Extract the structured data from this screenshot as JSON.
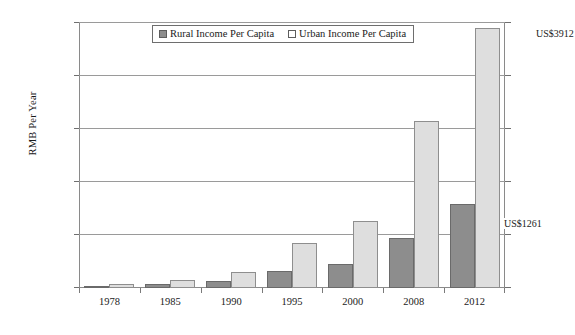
{
  "chart_data": {
    "type": "bar",
    "title": "",
    "xlabel": "",
    "ylabel": "RMB Per Year",
    "categories": [
      "1978",
      "1985",
      "1990",
      "1995",
      "2000",
      "2008",
      "2012"
    ],
    "series": [
      {
        "name": "Rural Income Per Capita",
        "color": "#8d8d8d",
        "values": [
          134,
          398,
          686,
          1578,
          2253,
          4761,
          7917
        ]
      },
      {
        "name": "Urban Income Per Capita",
        "color": "#dedede",
        "values": [
          343,
          739,
          1510,
          4283,
          6280,
          15781,
          24565
        ]
      }
    ],
    "ylim": [
      0,
      25000
    ],
    "yticks": [
      0,
      5000,
      10000,
      15000,
      20000,
      25000
    ],
    "ytick_labels": [
      "0",
      "5000",
      "10000",
      "15000",
      "20000",
      "25000"
    ],
    "grid": true,
    "legend_position": "top-center",
    "annotations": [
      {
        "text": "US$3912",
        "target": "2012 Urban Income Per Capita"
      },
      {
        "text": "US$1261",
        "target": "2012 Rural Income Per Capita"
      }
    ]
  },
  "legend": {
    "entries": [
      {
        "label": "Rural Income Per Capita",
        "swatch": "filled-gray-square"
      },
      {
        "label": "Urban Income Per Capita",
        "swatch": "open-white-square"
      }
    ]
  },
  "axes": {
    "y_title": "RMB Per Year"
  }
}
